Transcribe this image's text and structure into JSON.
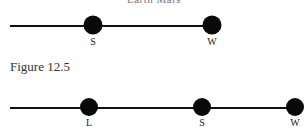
{
  "top_caption": "Earth Mars",
  "figures": [
    {
      "id": "figure-top",
      "line": {
        "x1": 10,
        "x2": 212,
        "y": 26
      },
      "nodes": [
        {
          "label": "S",
          "x": 93,
          "y": 25,
          "r": 9.5
        },
        {
          "label": "W",
          "x": 212,
          "y": 25,
          "r": 9.5
        }
      ]
    },
    {
      "id": "figure-12-5",
      "caption": "Figure 12.5",
      "line": {
        "x1": 10,
        "x2": 298,
        "y": 38
      },
      "nodes": [
        {
          "label": "L",
          "x": 89,
          "y": 37,
          "r": 9
        },
        {
          "label": "S",
          "x": 202,
          "y": 37,
          "r": 9
        },
        {
          "label": "W",
          "x": 295,
          "y": 37,
          "r": 9
        }
      ]
    }
  ],
  "colors": {
    "line": "#111111",
    "node": "#0a0a0a",
    "label": "#222222"
  }
}
